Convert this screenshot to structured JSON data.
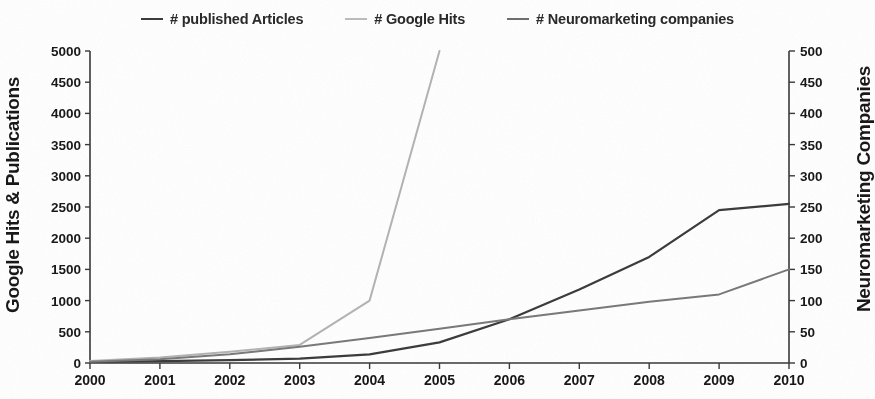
{
  "chart_data": {
    "type": "line",
    "title": "",
    "subtitle": "",
    "xlabel": "",
    "ylabel": "Google Hits & Publications",
    "ylabel_right": "Neuromarketing Companies",
    "grid": false,
    "legend_position": "top-center",
    "x": [
      2000,
      2001,
      2002,
      2003,
      2004,
      2005,
      2006,
      2007,
      2008,
      2009,
      2010
    ],
    "categories": [
      "2000",
      "2001",
      "2002",
      "2003",
      "2004",
      "2005",
      "2006",
      "2007",
      "2008",
      "2009",
      "2010"
    ],
    "xlim": [
      2000,
      2010
    ],
    "ylim": [
      0,
      5000
    ],
    "ylim_right": [
      0,
      500
    ],
    "yticks": [
      0,
      500,
      1000,
      1500,
      2000,
      2500,
      3000,
      3500,
      4000,
      4500,
      5000
    ],
    "yticks_right": [
      0,
      50,
      100,
      150,
      200,
      250,
      300,
      350,
      400,
      450,
      500
    ],
    "series": [
      {
        "name": "# published Articles",
        "axis": "left",
        "color": "#3c3c3c",
        "width": 2.2,
        "values": [
          20,
          30,
          45,
          70,
          140,
          330,
          700,
          1180,
          1700,
          2450,
          2550
        ]
      },
      {
        "name": "# Google Hits",
        "axis": "left",
        "color": "#b4b4b4",
        "width": 2.0,
        "clipped_above": true,
        "values": [
          30,
          90,
          180,
          290,
          1000,
          5000,
          null,
          null,
          null,
          null,
          null
        ],
        "note": "Line exits the top of the plot between 2004 and 2005; values beyond 5000 are off-scale."
      },
      {
        "name": "# Neuromarketing companies",
        "axis": "right",
        "color": "#7a7a7a",
        "width": 2.0,
        "values": [
          2,
          6,
          14,
          26,
          40,
          55,
          70,
          84,
          98,
          110,
          150
        ]
      }
    ]
  },
  "legend": {
    "items": [
      {
        "label": "# published Articles",
        "color": "#3c3c3c",
        "width": 2.6
      },
      {
        "label": "# Google Hits",
        "color": "#bdbdbd",
        "width": 2.2
      },
      {
        "label": "# Neuromarketing companies",
        "color": "#6f6f6f",
        "width": 2.6
      }
    ]
  },
  "axes": {
    "left_title": "Google Hits & Publications",
    "right_title": "Neuromarketing Companies"
  }
}
